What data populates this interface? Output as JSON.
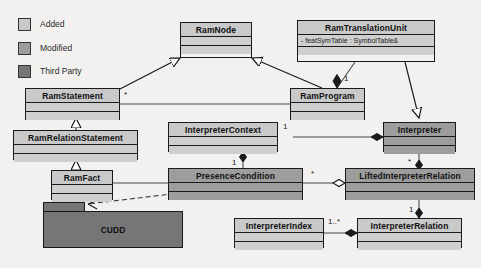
{
  "diagram": {
    "type": "uml-class-diagram",
    "background": "#f2f1ef",
    "legend": {
      "items": [
        {
          "label": "Added",
          "color": "#c9c9c9"
        },
        {
          "label": "Modified",
          "color": "#9d9d9d"
        },
        {
          "label": "Third Party",
          "color": "#767676"
        }
      ]
    },
    "classes": [
      {
        "id": "ramnode",
        "name": "RamNode",
        "category": "Added",
        "attributes": []
      },
      {
        "id": "ramtranslationunit",
        "name": "RamTranslationUnit",
        "category": "Added",
        "attributes": [
          "- featSymTable : SymbolTable&"
        ]
      },
      {
        "id": "ramstatement",
        "name": "RamStatement",
        "category": "Added",
        "attributes": []
      },
      {
        "id": "ramprogram",
        "name": "RamProgram",
        "category": "Added",
        "attributes": []
      },
      {
        "id": "ramrelationstatement",
        "name": "RamRelationStatement",
        "category": "Added",
        "attributes": []
      },
      {
        "id": "interpretercontext",
        "name": "InterpreterContext",
        "category": "Added",
        "attributes": []
      },
      {
        "id": "interpreter",
        "name": "Interpreter",
        "category": "Modified",
        "attributes": []
      },
      {
        "id": "ramfact",
        "name": "RamFact",
        "category": "Added",
        "attributes": []
      },
      {
        "id": "presencecondition",
        "name": "PresenceCondition",
        "category": "Modified",
        "attributes": []
      },
      {
        "id": "liftedinterpreterrelation",
        "name": "LiftedInterpreterRelation",
        "category": "Modified",
        "attributes": []
      },
      {
        "id": "interpreterindex",
        "name": "InterpreterIndex",
        "category": "Added",
        "attributes": []
      },
      {
        "id": "interpreterrelation",
        "name": "InterpreterRelation",
        "category": "Added",
        "attributes": []
      }
    ],
    "packages": [
      {
        "id": "cudd",
        "name": "CUDD",
        "category": "Third Party"
      }
    ],
    "multiplicities": [
      {
        "id": "m-ramstatement-star",
        "text": "*"
      },
      {
        "id": "m-ramtranslationunit-one",
        "text": "1"
      },
      {
        "id": "m-interpretercontext-one",
        "text": "1"
      },
      {
        "id": "m-presencecondition-one",
        "text": "1"
      },
      {
        "id": "m-presencecondition-star",
        "text": "*"
      },
      {
        "id": "m-interpreter-star",
        "text": "*"
      },
      {
        "id": "m-liftedrelation-one",
        "text": "1"
      },
      {
        "id": "m-interpreterindex-onestar",
        "text": "1..*"
      }
    ]
  }
}
